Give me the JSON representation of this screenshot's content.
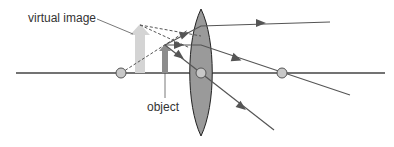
{
  "diagram": {
    "labels": {
      "virtual_image": "virtual image",
      "object": "object"
    },
    "colors": {
      "axis": "#444444",
      "ray": "#555555",
      "lens_fill": "#9a9a9a",
      "lens_stroke": "#222222",
      "focal_point": "#c8c8c8",
      "object_arrow": "#8c8c8c",
      "image_arrow": "#d4d4d4"
    },
    "elements": {
      "optical_axis": "principal axis",
      "lens": "convex lens",
      "focal_points": [
        "near focal point",
        "lens center",
        "far focal point"
      ],
      "rays": [
        "parallel ray",
        "focal ray",
        "central ray"
      ]
    }
  }
}
